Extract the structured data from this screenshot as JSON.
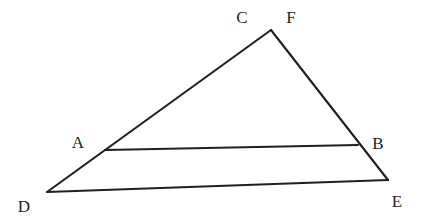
{
  "figure": {
    "background_color": "#ffffff",
    "stroke_color": "#1f1f1f",
    "label_color": "#232323",
    "stroke_width": 2.1,
    "width": 422,
    "height": 224,
    "labels": [
      {
        "id": "C",
        "text": "C",
        "x": 242,
        "y": 17
      },
      {
        "id": "F",
        "text": "F",
        "x": 291,
        "y": 17
      },
      {
        "id": "A",
        "text": "A",
        "x": 78,
        "y": 142
      },
      {
        "id": "B",
        "text": "B",
        "x": 378,
        "y": 143
      },
      {
        "id": "D",
        "text": "D",
        "x": 24,
        "y": 206
      },
      {
        "id": "E",
        "text": "E",
        "x": 397,
        "y": 201
      }
    ],
    "points": {
      "apex": {
        "x": 271,
        "y": 30
      },
      "A": {
        "x": 105,
        "y": 150
      },
      "B": {
        "x": 358,
        "y": 145
      },
      "D": {
        "x": 47,
        "y": 192
      },
      "E": {
        "x": 388,
        "y": 180
      }
    },
    "segments": [
      {
        "id": "apex-D",
        "name": "left-side-CD",
        "x1": 271,
        "y1": 30,
        "x2": 47,
        "y2": 192
      },
      {
        "id": "apex-E",
        "name": "right-side-FE",
        "x1": 271,
        "y1": 30,
        "x2": 388,
        "y2": 180
      },
      {
        "id": "A-B",
        "name": "segment-AB",
        "x1": 105,
        "y1": 150,
        "x2": 358,
        "y2": 145
      },
      {
        "id": "D-E",
        "name": "segment-DE",
        "x1": 47,
        "y1": 192,
        "x2": 388,
        "y2": 180
      }
    ]
  }
}
